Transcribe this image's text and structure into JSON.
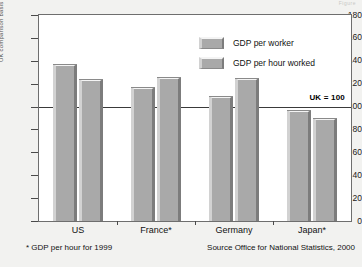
{
  "corner_scrap": "Figure",
  "chart_data": {
    "type": "bar",
    "title": "",
    "xlabel": "",
    "ylabel": "UK comparison basis",
    "ylim": [
      0,
      180
    ],
    "yticks": [
      0,
      20,
      40,
      60,
      80,
      100,
      120,
      140,
      160,
      180
    ],
    "grid": false,
    "legend_position": "top-center",
    "categories": [
      "US",
      "France*",
      "Germany",
      "Japan*"
    ],
    "series": [
      {
        "name": "GDP per worker",
        "values": [
          137,
          117,
          109,
          97
        ]
      },
      {
        "name": "GDP per hour worked",
        "values": [
          124,
          126,
          125,
          90
        ]
      }
    ],
    "annotations": [
      {
        "name": "uk-reference",
        "label": "UK = 100",
        "value": 100
      }
    ],
    "footnote": "* GDP per hour for 1999",
    "source": "Source  Office for National Statistics, 2000"
  },
  "colors": {
    "bar_fill": "#a9a9a9",
    "bar_top": "#f4f4f4",
    "bar_shadow": "#7c7c7c",
    "frame": "#6e6e6e",
    "plot_background": "#ffffff",
    "page_background": "#f2f2f0",
    "reference_line": "#3a3a3a"
  }
}
